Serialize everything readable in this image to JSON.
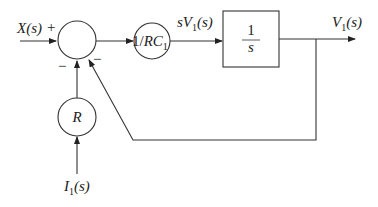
{
  "diagram": {
    "type": "block-diagram",
    "inputs": {
      "x": "X(s)",
      "i1_main": "I",
      "i1_sub": "1",
      "i1_tail": "(s)"
    },
    "summing_junction": {
      "signs": {
        "x": "+",
        "r": "−",
        "feedback": "−"
      }
    },
    "blocks": {
      "gain_rc": {
        "prefix": "1/",
        "main": "RC",
        "sub": "1"
      },
      "r_gain": {
        "label": "R"
      },
      "integrator": {
        "num": "1",
        "den": "s"
      }
    },
    "signals": {
      "sv1_pre": "sV",
      "sv1_sub": "1",
      "sv1_tail": "(s)",
      "v1_main": "V",
      "v1_sub": "1",
      "v1_tail": "(s)"
    }
  }
}
